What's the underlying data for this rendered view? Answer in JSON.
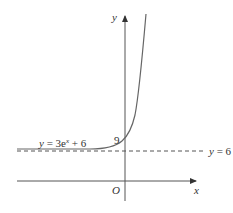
{
  "diagram": {
    "axes": {
      "x_label": "x",
      "y_label": "y",
      "origin_label": "O"
    },
    "curve": {
      "equation_label": "y = 3e",
      "equation_exponent": "x",
      "equation_tail": " + 6"
    },
    "asymptote": {
      "label": "y = 6",
      "style": "dashed"
    },
    "y_intercept": {
      "label": "9"
    },
    "colors": {
      "stroke": "#555555",
      "text": "#333333"
    }
  }
}
